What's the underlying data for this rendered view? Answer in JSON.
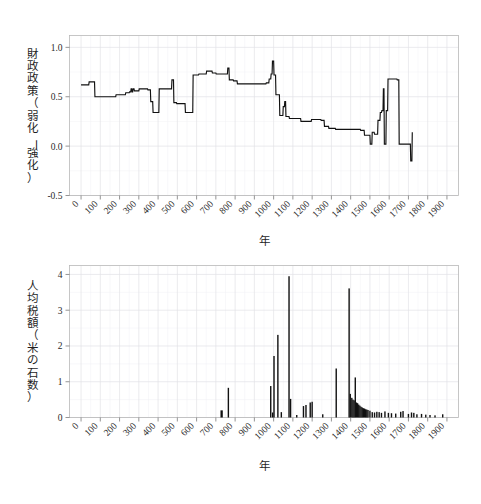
{
  "page": {
    "background_color": "#ffffff",
    "line_color": "#111111",
    "grid_color": "#e2e2e6",
    "frame_color": "#b9b9b9"
  },
  "chart_data": [
    {
      "id": "fiscal-policy",
      "type": "line",
      "title": "",
      "xlabel": "年",
      "ylabel": "財政政策（弱化ー強化）",
      "xlim": [
        -60,
        1960
      ],
      "ylim": [
        -0.5,
        1.12
      ],
      "grid": true,
      "legend": "none",
      "xticks": [
        0,
        100,
        200,
        300,
        400,
        500,
        600,
        700,
        800,
        900,
        1000,
        1100,
        1200,
        1300,
        1400,
        1500,
        1600,
        1700,
        1800,
        1900
      ],
      "xticklabels": [
        "0",
        "100",
        "200",
        "300",
        "400",
        "500",
        "600",
        "700",
        "800",
        "900",
        "1000",
        "1100",
        "1200",
        "1300",
        "1400",
        "1500",
        "1600",
        "1700",
        "1800",
        "1900"
      ],
      "yticks": [
        -0.5,
        0.0,
        0.5,
        1.0
      ],
      "yticklabels": [
        "-0.5",
        "0.0",
        "0.5",
        "1.0"
      ],
      "x": [
        0,
        40,
        42,
        70,
        72,
        95,
        97,
        180,
        182,
        230,
        232,
        250,
        252,
        258,
        260,
        263,
        265,
        268,
        270,
        275,
        277,
        300,
        302,
        345,
        347,
        360,
        362,
        372,
        374,
        395,
        397,
        404,
        406,
        420,
        422,
        470,
        472,
        480,
        482,
        495,
        497,
        540,
        542,
        570,
        572,
        580,
        582,
        610,
        612,
        650,
        652,
        680,
        682,
        700,
        702,
        740,
        742,
        760,
        762,
        768,
        770,
        790,
        792,
        810,
        812,
        960,
        962,
        975,
        977,
        985,
        987,
        992,
        994,
        1000,
        1002,
        1010,
        1012,
        1030,
        1032,
        1048,
        1050,
        1056,
        1058,
        1062,
        1064,
        1080,
        1082,
        1140,
        1142,
        1195,
        1197,
        1245,
        1247,
        1262,
        1264,
        1285,
        1287,
        1320,
        1322,
        1450,
        1452,
        1470,
        1472,
        1500,
        1502,
        1510,
        1512,
        1522,
        1524,
        1540,
        1542,
        1552,
        1554,
        1560,
        1562,
        1568,
        1570,
        1573,
        1575,
        1583,
        1585,
        1592,
        1594,
        1640,
        1642,
        1650,
        1652,
        1700,
        1702,
        1710,
        1712,
        1718,
        1720
      ],
      "y": [
        0.62,
        0.62,
        0.65,
        0.65,
        0.5,
        0.5,
        0.5,
        0.5,
        0.52,
        0.52,
        0.54,
        0.54,
        0.55,
        0.55,
        0.58,
        0.58,
        0.55,
        0.55,
        0.58,
        0.58,
        0.56,
        0.56,
        0.58,
        0.58,
        0.57,
        0.57,
        0.45,
        0.45,
        0.34,
        0.34,
        0.34,
        0.34,
        0.58,
        0.58,
        0.58,
        0.58,
        0.67,
        0.67,
        0.44,
        0.44,
        0.43,
        0.43,
        0.34,
        0.34,
        0.34,
        0.34,
        0.72,
        0.72,
        0.73,
        0.73,
        0.76,
        0.76,
        0.74,
        0.74,
        0.73,
        0.73,
        0.73,
        0.73,
        0.79,
        0.79,
        0.67,
        0.67,
        0.66,
        0.66,
        0.63,
        0.63,
        0.64,
        0.64,
        0.68,
        0.68,
        0.73,
        0.73,
        0.86,
        0.86,
        0.72,
        0.72,
        0.52,
        0.52,
        0.31,
        0.31,
        0.4,
        0.4,
        0.45,
        0.45,
        0.3,
        0.3,
        0.28,
        0.28,
        0.25,
        0.25,
        0.27,
        0.27,
        0.26,
        0.26,
        0.2,
        0.2,
        0.18,
        0.18,
        0.17,
        0.17,
        0.16,
        0.16,
        0.11,
        0.11,
        0.02,
        0.02,
        0.14,
        0.14,
        0.12,
        0.12,
        0.26,
        0.26,
        0.34,
        0.34,
        0.36,
        0.36,
        0.58,
        0.58,
        0.02,
        0.02,
        0.36,
        0.36,
        0.68,
        0.68,
        0.67,
        0.67,
        0.02,
        0.02,
        0.02,
        0.02,
        -0.15,
        -0.15,
        0.14
      ]
    },
    {
      "id": "tax-per-capita",
      "type": "bar",
      "title": "",
      "xlabel": "年",
      "ylabel": "人均税額（米の石数）",
      "xlim": [
        -60,
        1960
      ],
      "ylim": [
        0,
        4.25
      ],
      "grid": true,
      "legend": "none",
      "xticks": [
        0,
        100,
        200,
        300,
        400,
        500,
        600,
        700,
        800,
        900,
        1000,
        1100,
        1200,
        1300,
        1400,
        1500,
        1600,
        1700,
        1800,
        1900
      ],
      "xticklabels": [
        "0",
        "100",
        "200",
        "300",
        "400",
        "500",
        "600",
        "700",
        "800",
        "900",
        "1000",
        "1100",
        "1200",
        "1300",
        "1400",
        "1500",
        "1600",
        "1700",
        "1800",
        "1900"
      ],
      "yticks": [
        0,
        1,
        2,
        3,
        4
      ],
      "yticklabels": [
        "0",
        "1",
        "2",
        "3",
        "4"
      ],
      "bar_width": 8,
      "bars": [
        {
          "x": 730,
          "y": 0.2,
          "w": 12
        },
        {
          "x": 765,
          "y": 0.83,
          "w": 4
        },
        {
          "x": 985,
          "y": 0.88,
          "w": 5
        },
        {
          "x": 995,
          "y": 0.14,
          "w": 5
        },
        {
          "x": 1002,
          "y": 1.72,
          "w": 4
        },
        {
          "x": 1022,
          "y": 2.31,
          "w": 4
        },
        {
          "x": 1040,
          "y": 0.15,
          "w": 5
        },
        {
          "x": 1080,
          "y": 3.95,
          "w": 4
        },
        {
          "x": 1088,
          "y": 0.52,
          "w": 5
        },
        {
          "x": 1120,
          "y": 0.07,
          "w": 5
        },
        {
          "x": 1155,
          "y": 0.32,
          "w": 5
        },
        {
          "x": 1168,
          "y": 0.35,
          "w": 5
        },
        {
          "x": 1190,
          "y": 0.42,
          "w": 6
        },
        {
          "x": 1200,
          "y": 0.44,
          "w": 6
        },
        {
          "x": 1255,
          "y": 0.09,
          "w": 5
        },
        {
          "x": 1325,
          "y": 1.37,
          "w": 4
        },
        {
          "x": 1392,
          "y": 3.61,
          "w": 4
        },
        {
          "x": 1398,
          "y": 0.66,
          "w": 5
        },
        {
          "x": 1406,
          "y": 0.55,
          "w": 5
        },
        {
          "x": 1412,
          "y": 0.5,
          "w": 5
        },
        {
          "x": 1418,
          "y": 0.48,
          "w": 5
        },
        {
          "x": 1424,
          "y": 1.12,
          "w": 4
        },
        {
          "x": 1430,
          "y": 0.42,
          "w": 5
        },
        {
          "x": 1436,
          "y": 0.4,
          "w": 5
        },
        {
          "x": 1442,
          "y": 0.36,
          "w": 5
        },
        {
          "x": 1448,
          "y": 0.33,
          "w": 5
        },
        {
          "x": 1454,
          "y": 0.3,
          "w": 5
        },
        {
          "x": 1460,
          "y": 0.28,
          "w": 5
        },
        {
          "x": 1466,
          "y": 0.26,
          "w": 5
        },
        {
          "x": 1472,
          "y": 0.25,
          "w": 5
        },
        {
          "x": 1478,
          "y": 0.23,
          "w": 5
        },
        {
          "x": 1484,
          "y": 0.22,
          "w": 5
        },
        {
          "x": 1490,
          "y": 0.21,
          "w": 5
        },
        {
          "x": 1500,
          "y": 0.19,
          "w": 5
        },
        {
          "x": 1512,
          "y": 0.15,
          "w": 5
        },
        {
          "x": 1524,
          "y": 0.14,
          "w": 5
        },
        {
          "x": 1536,
          "y": 0.16,
          "w": 5
        },
        {
          "x": 1548,
          "y": 0.15,
          "w": 5
        },
        {
          "x": 1560,
          "y": 0.13,
          "w": 5
        },
        {
          "x": 1578,
          "y": 0.17,
          "w": 5
        },
        {
          "x": 1596,
          "y": 0.13,
          "w": 5
        },
        {
          "x": 1612,
          "y": 0.12,
          "w": 5
        },
        {
          "x": 1634,
          "y": 0.11,
          "w": 5
        },
        {
          "x": 1660,
          "y": 0.16,
          "w": 5
        },
        {
          "x": 1672,
          "y": 0.18,
          "w": 5
        },
        {
          "x": 1700,
          "y": 0.1,
          "w": 5
        },
        {
          "x": 1716,
          "y": 0.14,
          "w": 5
        },
        {
          "x": 1728,
          "y": 0.13,
          "w": 5
        },
        {
          "x": 1744,
          "y": 0.09,
          "w": 5
        },
        {
          "x": 1768,
          "y": 0.1,
          "w": 5
        },
        {
          "x": 1790,
          "y": 0.08,
          "w": 5
        },
        {
          "x": 1812,
          "y": 0.07,
          "w": 5
        },
        {
          "x": 1838,
          "y": 0.06,
          "w": 5
        },
        {
          "x": 1878,
          "y": 0.09,
          "w": 6
        }
      ]
    }
  ]
}
